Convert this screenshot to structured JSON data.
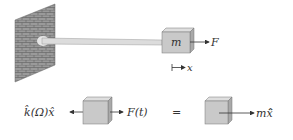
{
  "top_figure": {
    "mass_label": "m",
    "force_label": "F",
    "displacement_label": "x"
  },
  "equation": {
    "left_force_label": "k̂(Ω)x̂",
    "right_force_label": "F(t)",
    "equals": "=",
    "inertia_label": "mẍ̂"
  },
  "colors": {
    "box_front": "#c9c9c9",
    "box_top": "#dedede",
    "box_side": "#a9a9a9",
    "wall": "#8f8f8f",
    "rod": "#d8d8d8",
    "line": "#333333"
  }
}
